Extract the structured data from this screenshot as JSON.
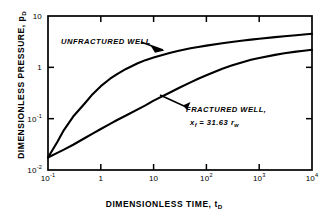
{
  "figure": {
    "background_color": "#ffffff",
    "ink_color": "#000000"
  },
  "axes": {
    "x": {
      "title": "DIMENSIONLESS TIME, t",
      "title_sub": "D",
      "tick_labels": [
        "10",
        "1",
        "10",
        "10",
        "10",
        "10"
      ],
      "tick_exponents": [
        "-1",
        "",
        "",
        "2",
        "3",
        "4"
      ],
      "tick_values": [
        0.1,
        1,
        10,
        100,
        1000,
        10000
      ]
    },
    "y": {
      "title": "DIMENSIONLESS PRESSURE, p",
      "title_sub": "D",
      "tick_labels": [
        "10",
        "1",
        "10",
        "10"
      ],
      "tick_exponents": [
        "",
        "",
        "-1",
        "-2"
      ],
      "tick_values": [
        10,
        1,
        0.1,
        0.01
      ]
    }
  },
  "annotations": {
    "unfractured": "UNFRACTURED WELL",
    "fractured_line1": "FRACTURED WELL,",
    "fractured_line2_prefix": "x",
    "fractured_line2_sub1": "f",
    "fractured_line2_mid": " = 31.63  r",
    "fractured_line2_sub2": "w"
  },
  "chart_data": {
    "type": "line",
    "title": "",
    "xlabel": "DIMENSIONLESS TIME, tD",
    "ylabel": "DIMENSIONLESS PRESSURE, pD",
    "xscale": "log",
    "yscale": "log",
    "xlim": [
      0.1,
      10000
    ],
    "ylim": [
      0.01,
      10
    ],
    "grid": false,
    "legend": "inline-annotations",
    "series": [
      {
        "name": "UNFRACTURED WELL",
        "x": [
          0.1,
          0.15,
          0.2,
          0.3,
          0.5,
          0.7,
          1,
          1.5,
          2,
          3,
          5,
          7,
          10,
          20,
          30,
          50,
          70,
          100,
          200,
          300,
          500,
          700,
          1000,
          2000,
          3000,
          5000,
          7000,
          10000
        ],
        "y": [
          0.0175,
          0.035,
          0.06,
          0.11,
          0.2,
          0.3,
          0.43,
          0.6,
          0.73,
          0.93,
          1.2,
          1.38,
          1.55,
          1.9,
          2.1,
          2.35,
          2.5,
          2.65,
          2.95,
          3.12,
          3.33,
          3.47,
          3.6,
          3.87,
          4.03,
          4.22,
          4.35,
          4.5
        ]
      },
      {
        "name": "FRACTURED WELL, xf = 31.63 rw",
        "x": [
          0.1,
          0.15,
          0.2,
          0.3,
          0.5,
          0.7,
          1,
          1.5,
          2,
          3,
          5,
          7,
          10,
          20,
          30,
          50,
          70,
          100,
          200,
          300,
          500,
          700,
          1000,
          2000,
          3000,
          5000,
          7000,
          10000
        ],
        "y": [
          0.0175,
          0.0215,
          0.025,
          0.031,
          0.042,
          0.051,
          0.063,
          0.079,
          0.093,
          0.115,
          0.152,
          0.182,
          0.225,
          0.32,
          0.395,
          0.51,
          0.6,
          0.7,
          0.94,
          1.08,
          1.27,
          1.4,
          1.52,
          1.75,
          1.88,
          2.02,
          2.1,
          2.2
        ]
      }
    ]
  }
}
